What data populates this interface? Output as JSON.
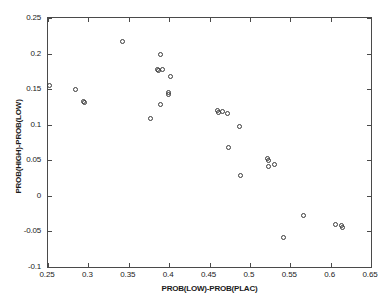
{
  "chart_data": {
    "type": "scatter",
    "title": "",
    "xlabel": "PROB(LOW)-PROB(PLAC)",
    "ylabel": "PROB(HIGH)-PROB(LOW)",
    "xlim": [
      0.25,
      0.65
    ],
    "ylim": [
      -0.1,
      0.25
    ],
    "xticks": [
      0.25,
      0.3,
      0.35,
      0.4,
      0.45,
      0.5,
      0.55,
      0.6,
      0.65
    ],
    "xticklabels": [
      "0.25",
      "0.3",
      "0.35",
      "0.4",
      "0.45",
      "0.5",
      "0.55",
      "0.6",
      "0.65"
    ],
    "yticks": [
      -0.1,
      -0.05,
      0,
      0.05,
      0.1,
      0.15,
      0.2,
      0.25
    ],
    "yticklabels": [
      "-0.1",
      "-0.05",
      "0",
      "0.05",
      "0.1",
      "0.15",
      "0.2",
      "0.25"
    ],
    "grid": false,
    "legend": null,
    "marker": "open-circle",
    "marker_color": "#3a3a3a",
    "points": [
      {
        "x": 0.2515,
        "y": 0.1555
      },
      {
        "x": 0.2835,
        "y": 0.1495
      },
      {
        "x": 0.2935,
        "y": 0.1325
      },
      {
        "x": 0.295,
        "y": 0.131
      },
      {
        "x": 0.342,
        "y": 0.217
      },
      {
        "x": 0.3765,
        "y": 0.1085
      },
      {
        "x": 0.385,
        "y": 0.178
      },
      {
        "x": 0.3865,
        "y": 0.1765
      },
      {
        "x": 0.3895,
        "y": 0.199
      },
      {
        "x": 0.3915,
        "y": 0.177
      },
      {
        "x": 0.3895,
        "y": 0.1285
      },
      {
        "x": 0.399,
        "y": 0.1455
      },
      {
        "x": 0.3995,
        "y": 0.142
      },
      {
        "x": 0.4015,
        "y": 0.168
      },
      {
        "x": 0.4605,
        "y": 0.1195
      },
      {
        "x": 0.4615,
        "y": 0.1165
      },
      {
        "x": 0.4655,
        "y": 0.1185
      },
      {
        "x": 0.4725,
        "y": 0.116
      },
      {
        "x": 0.474,
        "y": 0.0685
      },
      {
        "x": 0.4875,
        "y": 0.0975
      },
      {
        "x": 0.489,
        "y": 0.028
      },
      {
        "x": 0.5215,
        "y": 0.053
      },
      {
        "x": 0.5225,
        "y": 0.05
      },
      {
        "x": 0.5235,
        "y": 0.0415
      },
      {
        "x": 0.531,
        "y": 0.044
      },
      {
        "x": 0.5415,
        "y": -0.0585
      },
      {
        "x": 0.567,
        "y": -0.028
      },
      {
        "x": 0.6055,
        "y": -0.0405
      },
      {
        "x": 0.614,
        "y": -0.042
      },
      {
        "x": 0.615,
        "y": -0.044
      }
    ]
  },
  "axes": {
    "x_axis_name": "x-axis",
    "y_axis_name": "y-axis"
  }
}
